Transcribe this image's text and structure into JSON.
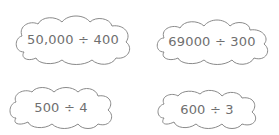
{
  "expressions": [
    {
      "id": "c1",
      "text": "50,000 ÷ 400"
    },
    {
      "id": "c2",
      "text": "69000 ÷ 300"
    },
    {
      "id": "c3",
      "text": "500 ÷ 4"
    },
    {
      "id": "c4",
      "text": "600 ÷ 3"
    }
  ],
  "colors": {
    "stroke": "#8a8a8a",
    "text": "#6f6f6f",
    "background": "#ffffff"
  }
}
